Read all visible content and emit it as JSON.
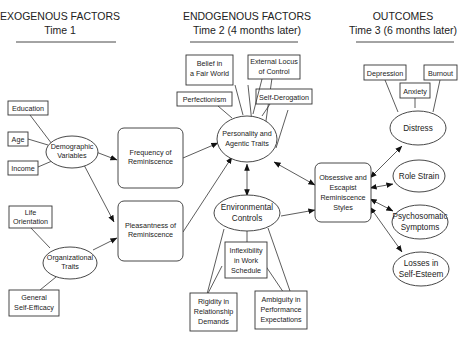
{
  "columns": [
    {
      "title": "EXOGENOUS FACTORS",
      "subtitle": "Time  1"
    },
    {
      "title": "ENDOGENOUS FACTORS",
      "subtitle": "Time 2  (4 months later)"
    },
    {
      "title": "OUTCOMES",
      "subtitle": "Time 3  (6 months later)"
    }
  ],
  "nodes": {
    "education": {
      "lines": [
        "Education"
      ]
    },
    "age": {
      "lines": [
        "Age"
      ]
    },
    "income": {
      "lines": [
        "Income"
      ]
    },
    "demographic": {
      "lines": [
        "Demographic",
        "Variables"
      ]
    },
    "life_orientation": {
      "lines": [
        "Life",
        "Orientation"
      ]
    },
    "organizational": {
      "lines": [
        "Organizational",
        "Traits"
      ]
    },
    "self_efficacy": {
      "lines": [
        "General",
        "Self-Efficacy"
      ]
    },
    "frequency": {
      "lines": [
        "Frequency of",
        "Reminiscence"
      ]
    },
    "pleasantness": {
      "lines": [
        "Pleasantness of",
        "Reminiscence"
      ]
    },
    "belief_fair_world": {
      "lines": [
        "Belief in",
        "a Fair World"
      ]
    },
    "external_locus": {
      "lines": [
        "External Locus",
        "of Control"
      ]
    },
    "perfectionism": {
      "lines": [
        "Perfectionism"
      ]
    },
    "self_derogation": {
      "lines": [
        "Self-Derogation"
      ]
    },
    "personality": {
      "lines": [
        "Personality and",
        "Agentic Traits"
      ]
    },
    "environmental": {
      "lines": [
        "Environmental",
        "Controls"
      ]
    },
    "inflexibility": {
      "lines": [
        "Inflexibility",
        "in Work",
        "Schedule"
      ]
    },
    "rigidity": {
      "lines": [
        "Rigidity in",
        "Relationship",
        "Demands"
      ]
    },
    "ambiguity": {
      "lines": [
        "Ambiguity in",
        "Performance",
        "Expectations"
      ]
    },
    "obsessive": {
      "lines": [
        "Obsessive and",
        "Escapist",
        "Reminiscence",
        "Styles"
      ]
    },
    "depression": {
      "lines": [
        "Depression"
      ]
    },
    "anxiety": {
      "lines": [
        "Anxiety"
      ]
    },
    "burnout": {
      "lines": [
        "Burnout"
      ]
    },
    "distress": {
      "lines": [
        "Distress"
      ]
    },
    "role_strain": {
      "lines": [
        "Role Strain"
      ]
    },
    "psychosomatic": {
      "lines": [
        "Psychosomatic",
        "Symptoms"
      ]
    },
    "losses_self_esteem": {
      "lines": [
        "Losses in",
        "Self-Esteem"
      ]
    }
  },
  "edges": [
    {
      "from": "Education",
      "to": "Demographic Variables",
      "type": "line"
    },
    {
      "from": "Age",
      "to": "Demographic Variables",
      "type": "line"
    },
    {
      "from": "Income",
      "to": "Demographic Variables",
      "type": "line"
    },
    {
      "from": "Life Orientation",
      "to": "Organizational Traits",
      "type": "line"
    },
    {
      "from": "General Self-Efficacy",
      "to": "Organizational Traits",
      "type": "line"
    },
    {
      "from": "Demographic Variables",
      "to": "Frequency of Reminiscence",
      "type": "arrow"
    },
    {
      "from": "Demographic Variables",
      "to": "Pleasantness of Reminiscence",
      "type": "arrow"
    },
    {
      "from": "Organizational Traits",
      "to": "Pleasantness of Reminiscence",
      "type": "arrow"
    },
    {
      "from": "Frequency of Reminiscence",
      "to": "Personality and Agentic Traits",
      "type": "arrow"
    },
    {
      "from": "Pleasantness of Reminiscence",
      "to": "Personality and Agentic Traits",
      "type": "arrow"
    },
    {
      "from": "Personality and Agentic Traits",
      "to": "Environmental Controls",
      "type": "double-arrow"
    },
    {
      "from": "Personality and Agentic Traits",
      "to": "Obsessive and Escapist Reminiscence Styles",
      "type": "double-arrow"
    },
    {
      "from": "Environmental Controls",
      "to": "Obsessive and Escapist Reminiscence Styles",
      "type": "arrow"
    },
    {
      "from": "Pleasantness of Reminiscence",
      "to": "Obsessive and Escapist Reminiscence Styles",
      "type": "arrow"
    },
    {
      "from": "Obsessive and Escapist Reminiscence Styles",
      "to": "Distress",
      "type": "double-arrow"
    },
    {
      "from": "Obsessive and Escapist Reminiscence Styles",
      "to": "Role Strain",
      "type": "double-arrow"
    },
    {
      "from": "Obsessive and Escapist Reminiscence Styles",
      "to": "Psychosomatic Symptoms",
      "type": "double-arrow"
    },
    {
      "from": "Obsessive and Escapist Reminiscence Styles",
      "to": "Losses in Self-Esteem",
      "type": "double-arrow"
    }
  ]
}
